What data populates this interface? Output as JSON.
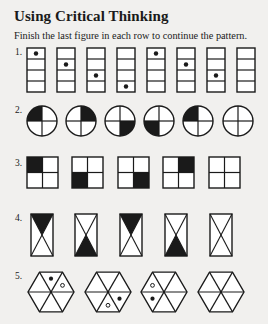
{
  "heading": {
    "title": "Using Critical Thinking",
    "instructions": "Finish the last figure in each row to continue the pattern."
  },
  "rows": [
    {
      "number": "1.",
      "shape": "vertical-rectangle-4-cells",
      "figures": [
        {
          "dot_cell": 1
        },
        {
          "dot_cell": 2
        },
        {
          "dot_cell": 3
        },
        {
          "dot_cell": 4
        },
        {
          "dot_cell": 1
        },
        {
          "dot_cell": 2
        },
        {
          "dot_cell": 3
        },
        {
          "dot_cell": null,
          "blank": true
        }
      ]
    },
    {
      "number": "2.",
      "shape": "circle-quadrants",
      "figures": [
        {
          "filled": "top-left"
        },
        {
          "filled": "top-right"
        },
        {
          "filled": "bottom-right"
        },
        {
          "filled": "bottom-left"
        },
        {
          "filled": "top-left"
        },
        {
          "filled": null,
          "blank": true
        }
      ]
    },
    {
      "number": "3.",
      "shape": "square-2x2",
      "figures": [
        {
          "filled": "top-left"
        },
        {
          "filled": "bottom-left"
        },
        {
          "filled": "bottom-right"
        },
        {
          "filled": "top-right"
        },
        {
          "filled": null,
          "blank": true
        }
      ]
    },
    {
      "number": "4.",
      "shape": "hourglass-rectangle",
      "figures": [
        {
          "filled": "top"
        },
        {
          "filled": "bottom"
        },
        {
          "filled": "top"
        },
        {
          "filled": "bottom"
        },
        {
          "filled": null,
          "blank": true
        }
      ]
    },
    {
      "number": "5.",
      "shape": "hexagon-6-triangles",
      "figures": [
        {
          "black_dot": "top",
          "white_dot": "upper-right"
        },
        {
          "black_dot": "lower-right",
          "white_dot": "bottom"
        },
        {
          "black_dot": "lower-left",
          "white_dot": "upper-left"
        },
        {
          "black_dot": null,
          "white_dot": null,
          "blank": true
        }
      ]
    }
  ],
  "colors": {
    "page": "#f1f0ee",
    "ink": "#1a1a1a",
    "cell": "#ffffff"
  }
}
